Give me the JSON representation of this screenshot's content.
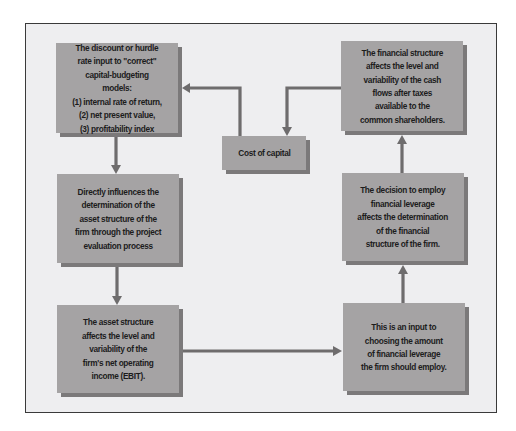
{
  "diagram": {
    "type": "flowchart",
    "colors": {
      "frame_background": "#eeeef0",
      "frame_border": "#3a3a3a",
      "box_fill": "#a5a3a4",
      "box_shadow": "#7b797a",
      "arrow": "#6e6c6d",
      "text": "#1c1c1c"
    },
    "nodes": [
      {
        "id": "discount-rate",
        "text": "The discount or hurdle\nrate input to \"correct\"\ncapital-budgeting models:\n(1) internal rate of return,\n(2) net present value,\n(3) profitability index"
      },
      {
        "id": "cost-of-capital",
        "text": "Cost of capital"
      },
      {
        "id": "financial-structure-effect",
        "text": "The financial structure\naffects the level and\nvariability of the cash\nflows after taxes\navailable to the\ncommon shareholders."
      },
      {
        "id": "asset-structure-determination",
        "text": "Directly influences the\ndetermination of the\nasset structure of the\nfirm through the project\nevaluation process"
      },
      {
        "id": "financial-leverage-decision",
        "text": "The decision to employ\nfinancial leverage\naffects the determination\nof the financial\nstructure of the firm."
      },
      {
        "id": "asset-structure-effect",
        "text": "The asset structure\naffects the level and\nvariability of the\nfirm's net operating\nincome (EBIT)."
      },
      {
        "id": "leverage-input",
        "text": "This is an input to\nchoosing the amount\nof financial leverage\nthe firm should employ."
      }
    ],
    "edges": [
      {
        "from": "cost-of-capital",
        "to": "discount-rate"
      },
      {
        "from": "discount-rate",
        "to": "asset-structure-determination"
      },
      {
        "from": "asset-structure-determination",
        "to": "asset-structure-effect"
      },
      {
        "from": "asset-structure-effect",
        "to": "leverage-input"
      },
      {
        "from": "leverage-input",
        "to": "financial-leverage-decision"
      },
      {
        "from": "financial-leverage-decision",
        "to": "financial-structure-effect"
      },
      {
        "from": "financial-structure-effect",
        "to": "cost-of-capital"
      }
    ]
  }
}
